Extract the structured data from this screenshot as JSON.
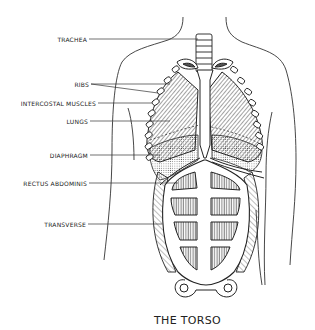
{
  "figure": {
    "title": "THE TORSO",
    "labels": [
      {
        "id": "trachea",
        "text": "TRACHEA"
      },
      {
        "id": "ribs",
        "text": "RIBS"
      },
      {
        "id": "intercostal",
        "text": "INTERCOSTAL MUSCLES"
      },
      {
        "id": "lungs",
        "text": "LUNGS"
      },
      {
        "id": "diaphragm",
        "text": "DIAPHRAGM"
      },
      {
        "id": "rectus",
        "text": "RECTUS ABDOMINIS"
      },
      {
        "id": "transverse",
        "text": "TRANSVERSE"
      }
    ]
  }
}
